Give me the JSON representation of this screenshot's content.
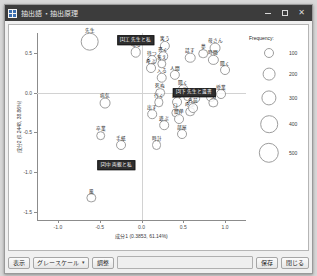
{
  "window": {
    "title": "抽出語・抽出原理",
    "icon": "grid-icon",
    "minimize_label": "—",
    "maximize_label": "□",
    "close_label": "✕"
  },
  "toolbar": {
    "display_label": "表示",
    "colormode_value": "グレースケール",
    "adjust_label": "調整",
    "field_value": "",
    "save_label": "保存",
    "close_label": "閉じる"
  },
  "legend": {
    "title": "Frequency:",
    "items": [
      {
        "value": "100",
        "r": 5.0
      },
      {
        "value": "200",
        "r": 6.4
      },
      {
        "value": "300",
        "r": 7.6
      },
      {
        "value": "400",
        "r": 8.8
      },
      {
        "value": "500",
        "r": 10.2
      }
    ]
  },
  "chart_data": {
    "type": "scatter",
    "title": "抽出語・抽出原理",
    "xlabel": "成分1 (0.3853, 61.14%)",
    "ylabel": "成分2 (0.2448, 38.86%)",
    "xlim": [
      -1.25,
      1.25
    ],
    "ylim": [
      -1.6,
      0.75
    ],
    "xticks": [
      "-1.0",
      "-0.5",
      "0.0",
      "0.5",
      "1.0"
    ],
    "xtickvals": [
      -1.0,
      -0.5,
      0.0,
      0.5,
      1.0
    ],
    "yticks": [
      "0.5",
      "0.0",
      "-0.5",
      "-1.0",
      "-1.5"
    ],
    "ytickvals": [
      0.5,
      0.0,
      -0.5,
      -1.0,
      -1.5
    ],
    "grid": true,
    "legend_position": "right",
    "size_encodes": "Frequency",
    "points": [
      {
        "label": "先生",
        "x": -0.62,
        "y": 0.64,
        "f": 430
      },
      {
        "label": "鳴る",
        "x": -0.07,
        "y": 0.51,
        "f": 170
      },
      {
        "label": "待つ",
        "x": 0.13,
        "y": 0.41,
        "f": 150
      },
      {
        "label": "笑う",
        "x": 0.28,
        "y": 0.59,
        "f": 160
      },
      {
        "label": "呼ぶ",
        "x": 0.11,
        "y": 0.31,
        "f": 150
      },
      {
        "label": "書く",
        "x": 0.26,
        "y": 0.46,
        "f": 140
      },
      {
        "label": "答え",
        "x": 0.24,
        "y": 0.36,
        "f": 130
      },
      {
        "label": "入る",
        "x": 0.24,
        "y": 0.19,
        "f": 170
      },
      {
        "label": "人間",
        "x": 0.4,
        "y": 0.22,
        "f": 160
      },
      {
        "label": "話す",
        "x": 0.58,
        "y": 0.44,
        "f": 170
      },
      {
        "label": "夢",
        "x": 0.74,
        "y": 0.49,
        "f": 140
      },
      {
        "label": "母さん",
        "x": 0.88,
        "y": 0.56,
        "f": 180
      },
      {
        "label": "時間",
        "x": 0.86,
        "y": 0.41,
        "f": 160
      },
      {
        "label": "聞く",
        "x": 1.0,
        "y": 0.28,
        "f": 150
      },
      {
        "label": "病気",
        "x": -0.44,
        "y": -0.13,
        "f": 180
      },
      {
        "label": "死ぬ",
        "x": 0.22,
        "y": 0.0,
        "f": 140
      },
      {
        "label": "聞く",
        "x": 0.5,
        "y": 0.04,
        "f": 140
      },
      {
        "label": "泣く",
        "x": 0.56,
        "y": -0.05,
        "f": 140
      },
      {
        "label": "行く",
        "x": 0.21,
        "y": -0.12,
        "f": 130
      },
      {
        "label": "乗る",
        "x": 0.43,
        "y": -0.12,
        "f": 150
      },
      {
        "label": "出す",
        "x": 0.13,
        "y": -0.27,
        "f": 140
      },
      {
        "label": "口",
        "x": 0.41,
        "y": -0.25,
        "f": 130
      },
      {
        "label": "呼ぶ",
        "x": 0.58,
        "y": -0.24,
        "f": 140
      },
      {
        "label": "簡単",
        "x": 0.45,
        "y": -0.33,
        "f": 150
      },
      {
        "label": "遊ぶ",
        "x": 0.27,
        "y": -0.41,
        "f": 140
      },
      {
        "label": "部屋",
        "x": 0.49,
        "y": -0.52,
        "f": 150
      },
      {
        "label": "四分",
        "x": 0.64,
        "y": -0.07,
        "f": 140
      },
      {
        "label": "名前",
        "x": 0.62,
        "y": -0.19,
        "f": 150
      },
      {
        "label": "教え",
        "x": 0.83,
        "y": -0.06,
        "f": 150
      },
      {
        "label": "授業",
        "x": 0.95,
        "y": -0.02,
        "f": 150
      },
      {
        "label": "父",
        "x": 0.86,
        "y": -0.13,
        "f": 130
      },
      {
        "label": "卒業",
        "x": -0.49,
        "y": -0.54,
        "f": 140
      },
      {
        "label": "手紙",
        "x": -0.25,
        "y": -0.66,
        "f": 150
      },
      {
        "label": "時計",
        "x": 0.18,
        "y": -0.66,
        "f": 150
      },
      {
        "label": "風",
        "x": -0.6,
        "y": -1.32,
        "f": 130
      }
    ],
    "cluster_chips": [
      {
        "label": "[1]工 先生と私",
        "x": -0.07,
        "y": 0.66
      },
      {
        "label": "[3]下 先生と遺書",
        "x": 0.63,
        "y": 0.0
      },
      {
        "label": "[2]中 両親と私",
        "x": -0.3,
        "y": -0.91
      }
    ]
  }
}
